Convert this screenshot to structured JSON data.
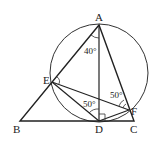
{
  "diagram": {
    "points": {
      "A": {
        "label": "A",
        "x": 99,
        "y": 25
      },
      "B": {
        "label": "B",
        "x": 20,
        "y": 121
      },
      "C": {
        "label": "C",
        "x": 134,
        "y": 121
      },
      "D": {
        "label": "D",
        "x": 99,
        "y": 121
      },
      "E": {
        "label": "E",
        "x": 52,
        "y": 82
      },
      "F": {
        "label": "F",
        "x": 129,
        "y": 110
      }
    },
    "circle": {
      "cx": 99,
      "cy": 73,
      "r": 49
    },
    "angles": [
      {
        "label": "40°",
        "at": "A"
      },
      {
        "label": "50°",
        "at": "D"
      },
      {
        "label": "50°",
        "at": "F"
      }
    ],
    "right_angles": [
      "E",
      "D",
      "F"
    ]
  }
}
